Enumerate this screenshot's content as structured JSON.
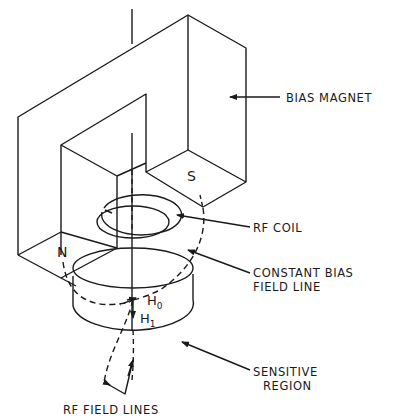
{
  "diagram": {
    "type": "technical-illustration",
    "colors": {
      "ink": "#1a1a1a",
      "background": "#ffffff"
    },
    "labels": {
      "bias_magnet": "BIAS MAGNET",
      "rf_coil": "RF COIL",
      "constant_bias_line1": "CONSTANT BIAS",
      "constant_bias_line2": "FIELD LINE",
      "sensitive_line1": "SENSITIVE",
      "sensitive_line2": "REGION",
      "rf_field_lines": "RF FIELD LINES"
    },
    "poles": {
      "north": "N",
      "south": "S"
    },
    "symbols": {
      "h0_main": "H",
      "h0_sub": "0",
      "h1_main": "H",
      "h1_sub": "1"
    }
  }
}
